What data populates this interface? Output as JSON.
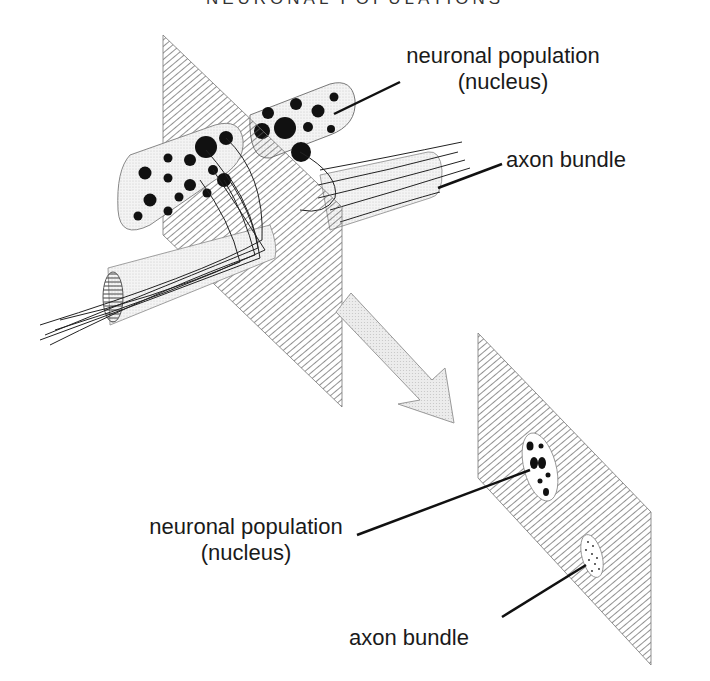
{
  "title": "NEURONAL POPULATIONS",
  "labels": {
    "top_nucleus_line1": "neuronal population",
    "top_nucleus_line2": "(nucleus)",
    "top_axon": "axon bundle",
    "bottom_nucleus_line1": "neuronal population",
    "bottom_nucleus_line2": "(nucleus)",
    "bottom_axon": "axon bundle"
  },
  "colors": {
    "ink": "#1a1a1a",
    "plane_hatch": "#555555",
    "stipple_fill": "#ededed",
    "arrow_fill": "#e6e6e6"
  },
  "panels": {
    "upper": "3D view: two nuclei and axon bundles crossing a hatched section plane",
    "lower": "Cross-section: hatched plane showing nucleus (large dots) and axon bundle (small dots)"
  }
}
